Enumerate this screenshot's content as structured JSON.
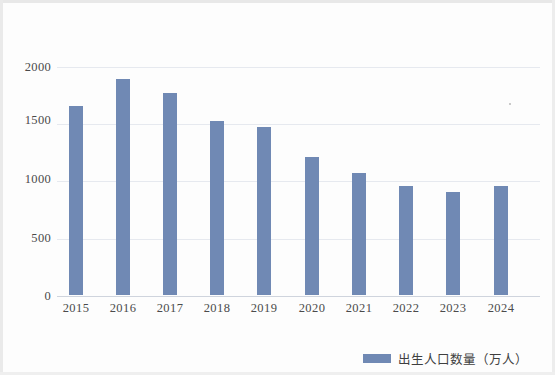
{
  "chart_data": {
    "type": "bar",
    "title": "",
    "subtitle": "",
    "xlabel": "",
    "ylabel": "",
    "categories": [
      "2015",
      "2016",
      "2017",
      "2018",
      "2019",
      "2020",
      "2021",
      "2022",
      "2023",
      "2024"
    ],
    "series": [
      {
        "name": "出生人口数量（万人）",
        "values": [
          1655,
          1883,
          1765,
          1523,
          1465,
          1202,
          1062,
          956,
          902,
          954
        ],
        "color": "#7089b4"
      }
    ],
    "values": [
      1655,
      1883,
      1765,
      1523,
      1465,
      1202,
      1062,
      956,
      902,
      954
    ],
    "ylim": [
      0,
      2000
    ],
    "y_ticks": [
      0,
      500,
      1000,
      1500,
      2000
    ],
    "y_tick_labels": [
      "0",
      "500",
      "1000",
      "1500",
      "2000"
    ],
    "grid": true,
    "grid_axis": "y",
    "legend": {
      "position": "bottom-right",
      "entries": [
        {
          "label": "出生人口数量（万人）",
          "color": "#7089b4"
        }
      ]
    },
    "annotations": []
  },
  "axis": {
    "y_labels": [
      "2000",
      "1500",
      "1000",
      "500",
      "0"
    ],
    "x_labels": [
      "2015",
      "2016",
      "2017",
      "2018",
      "2019",
      "2020",
      "2021",
      "2022",
      "2023",
      "2024"
    ]
  },
  "legend": {
    "label": "出生人口数量（万人）",
    "swatch_color": "#7089b4"
  },
  "colors": {
    "bar": "#7089b4",
    "gridline": "#e6e9ef",
    "baseline": "#cfd4dd",
    "text": "#4a4a4a",
    "background": "#fdfdfd"
  }
}
